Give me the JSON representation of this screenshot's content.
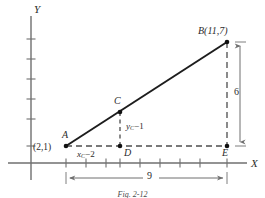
{
  "figure": {
    "caption": "Fig. 2-12",
    "axes": {
      "x_label": "X",
      "y_label": "Y"
    },
    "points": [
      {
        "id": "A",
        "name": "A",
        "coord_label": "(2,1)",
        "px": 66,
        "py": 146
      },
      {
        "id": "B",
        "name": "B",
        "coord_label": "B(11,7)",
        "px": 227,
        "py": 42
      },
      {
        "id": "C",
        "name": "C",
        "coord_label": "C",
        "px": 120,
        "py": 112
      },
      {
        "id": "D",
        "name": "D",
        "coord_label": "D",
        "px": 120,
        "py": 146
      },
      {
        "id": "E",
        "name": "E",
        "coord_label": "E",
        "px": 227,
        "py": 146
      }
    ],
    "labels": {
      "point_a": "A",
      "point_a_coords": "(2,1)",
      "point_b_coords": "B(11,7)",
      "point_c": "C",
      "point_d": "D",
      "point_e": "E",
      "x_seg_prefix": "x",
      "x_seg_sub": "C",
      "x_seg_suffix": "−2",
      "y_seg_prefix": "y",
      "y_seg_sub": "C",
      "y_seg_suffix": "−1",
      "dim_vertical": "6",
      "dim_horizontal": "9"
    },
    "colors": {
      "ink": "#2b2b2b",
      "axis": "#6f6f6f",
      "dash": "#555555",
      "dimension": "#6f6f6f",
      "background": "#ffffff"
    },
    "geometry": {
      "x_axis_y": 163,
      "y_axis_x": 31,
      "x_axis_start": 8,
      "x_axis_end": 247,
      "y_axis_top": 16,
      "y_axis_bottom": 180,
      "x_ticks": [
        66,
        86,
        106,
        120,
        140,
        160,
        180,
        200,
        227
      ],
      "y_ticks": [
        39,
        59,
        79,
        99,
        119,
        146
      ],
      "dim_line_y": 178,
      "dim_line_x": 240
    }
  }
}
